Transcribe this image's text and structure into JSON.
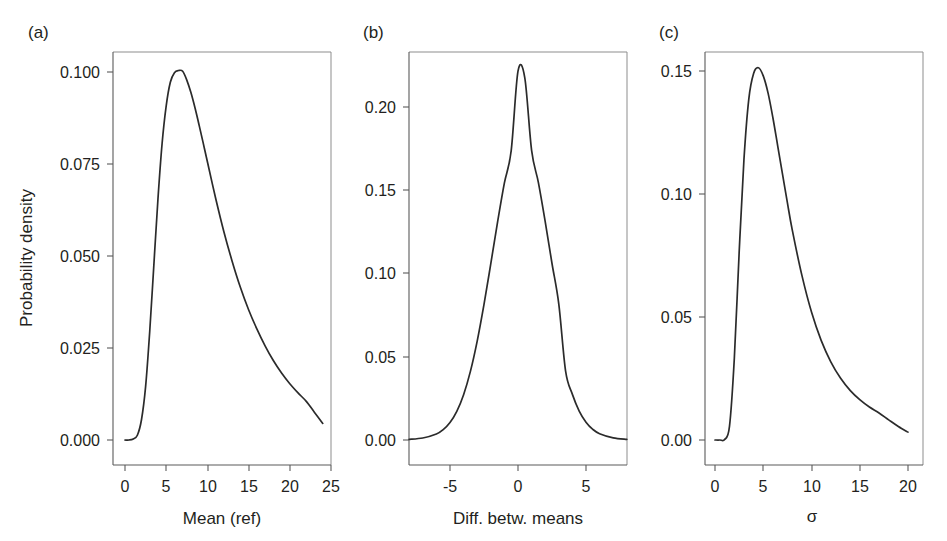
{
  "figure": {
    "background_color": "#ffffff",
    "curve_color": "#2b2b2b",
    "axis_color": "#5a5a5a",
    "shared_ylabel": "Probability density"
  },
  "panels": {
    "a": {
      "label": "(a)",
      "xlabel": "Mean (ref)",
      "ylabel": "Probability density",
      "xticks": [
        "0",
        "5",
        "10",
        "15",
        "20",
        "25"
      ],
      "yticks": [
        "0.000",
        "0.025",
        "0.050",
        "0.075",
        "0.100"
      ]
    },
    "b": {
      "label": "(b)",
      "xlabel": "Diff. betw. means",
      "ylabel": "",
      "xticks": [
        "-5",
        "0",
        "5"
      ],
      "yticks": [
        "0.00",
        "0.05",
        "0.10",
        "0.15",
        "0.20"
      ]
    },
    "c": {
      "label": "(c)",
      "xlabel": "σ",
      "ylabel": "",
      "xticks": [
        "0",
        "5",
        "10",
        "15",
        "20"
      ],
      "yticks": [
        "0.00",
        "0.05",
        "0.10",
        "0.15"
      ]
    }
  },
  "chart_data": [
    {
      "type": "line",
      "panel": "a",
      "title": "(a)",
      "xlabel": "Mean (ref)",
      "ylabel": "Probability density",
      "xlim": [
        -0.8,
        25.0
      ],
      "ylim": [
        -0.0035,
        0.1075
      ],
      "xticks": [
        0,
        5,
        10,
        15,
        20,
        25
      ],
      "yticks": [
        0.0,
        0.025,
        0.05,
        0.075,
        0.1
      ],
      "grid": false,
      "legend": "none",
      "peak": {
        "x": 6.9,
        "y": 0.1005
      },
      "x": [
        0.0,
        0.5,
        1.0,
        1.5,
        2.0,
        2.5,
        3.0,
        3.5,
        4.0,
        4.5,
        5.0,
        5.5,
        6.0,
        6.5,
        7.0,
        7.5,
        8.0,
        8.5,
        9.0,
        9.5,
        10.0,
        11.0,
        12.0,
        13.0,
        14.0,
        15.0,
        16.0,
        17.0,
        18.0,
        19.0,
        20.0,
        21.0,
        22.0,
        23.0,
        24.0
      ],
      "y": [
        0.0,
        0.0,
        0.0003,
        0.0013,
        0.0055,
        0.0145,
        0.0295,
        0.0475,
        0.0655,
        0.0805,
        0.0908,
        0.0972,
        0.0998,
        0.1004,
        0.1002,
        0.0978,
        0.0944,
        0.0902,
        0.0855,
        0.0806,
        0.0756,
        0.0657,
        0.0566,
        0.0486,
        0.0415,
        0.0354,
        0.0302,
        0.0256,
        0.0216,
        0.0182,
        0.0153,
        0.0128,
        0.0105,
        0.0075,
        0.0045
      ]
    },
    {
      "type": "line",
      "panel": "b",
      "title": "(b)",
      "xlabel": "Diff. betw. means",
      "ylabel": "",
      "xlim": [
        -8.0,
        8.0
      ],
      "ylim": [
        -0.0075,
        0.2325
      ],
      "xticks": [
        -5,
        0,
        5
      ],
      "yticks": [
        0.0,
        0.05,
        0.1,
        0.15,
        0.2
      ],
      "grid": false,
      "legend": "none",
      "peak": {
        "x": 0.1,
        "y": 0.2225
      },
      "x": [
        -8.0,
        -7.0,
        -6.0,
        -5.5,
        -5.0,
        -4.5,
        -4.0,
        -3.5,
        -3.0,
        -2.5,
        -2.0,
        -1.5,
        -1.0,
        -0.5,
        0.0,
        0.5,
        1.0,
        1.5,
        2.0,
        2.5,
        3.0,
        3.5,
        4.0,
        4.5,
        5.0,
        5.5,
        6.0,
        7.0,
        8.0
      ],
      "y": [
        0.0004,
        0.0012,
        0.0036,
        0.0062,
        0.0105,
        0.0172,
        0.0272,
        0.0412,
        0.0594,
        0.0814,
        0.1059,
        0.131,
        0.1544,
        0.1738,
        0.2215,
        0.2175,
        0.174,
        0.1546,
        0.1312,
        0.106,
        0.0816,
        0.0414,
        0.0274,
        0.0174,
        0.0107,
        0.0064,
        0.0038,
        0.0013,
        0.0004
      ]
    },
    {
      "type": "line",
      "panel": "c",
      "title": "(c)",
      "xlabel": "σ",
      "ylabel": "",
      "xlim": [
        -0.5,
        20.8
      ],
      "ylim": [
        -0.005,
        0.162
      ],
      "xticks": [
        0,
        5,
        10,
        15,
        20
      ],
      "yticks": [
        0.0,
        0.05,
        0.1,
        0.15
      ],
      "grid": false,
      "legend": "none",
      "peak": {
        "x": 4.7,
        "y": 0.1515
      },
      "x": [
        0.0,
        0.5,
        1.0,
        1.5,
        2.0,
        2.5,
        3.0,
        3.5,
        4.0,
        4.5,
        5.0,
        5.5,
        6.0,
        6.5,
        7.0,
        7.5,
        8.0,
        9.0,
        10.0,
        11.0,
        12.0,
        13.0,
        14.0,
        15.0,
        16.0,
        17.0,
        18.0,
        19.0,
        20.0
      ],
      "y": [
        0.0,
        0.0,
        0.0002,
        0.0055,
        0.033,
        0.076,
        0.114,
        0.1385,
        0.149,
        0.1513,
        0.148,
        0.141,
        0.131,
        0.1195,
        0.108,
        0.0965,
        0.0855,
        0.067,
        0.052,
        0.0405,
        0.0318,
        0.0252,
        0.0202,
        0.0164,
        0.0134,
        0.011,
        0.0082,
        0.0055,
        0.0032
      ]
    }
  ]
}
